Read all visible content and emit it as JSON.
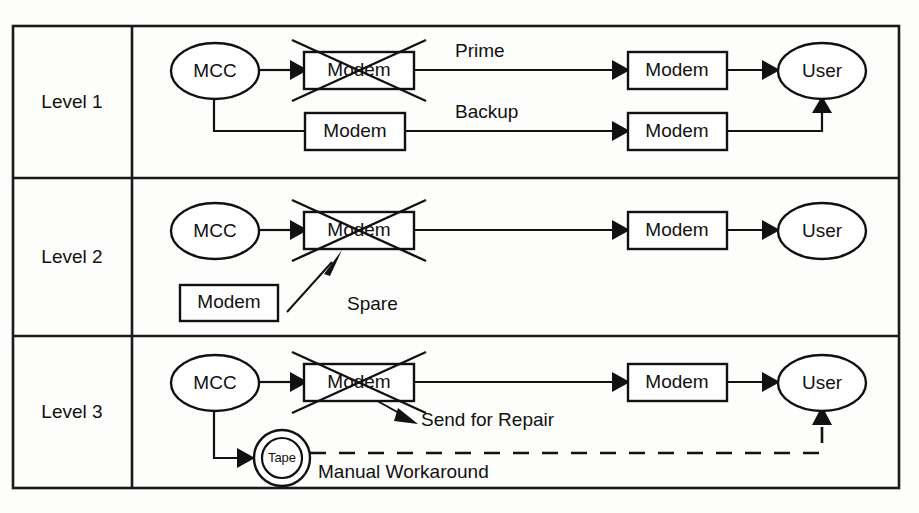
{
  "diagram": {
    "frame": {
      "stroke_color": "#1a1a1a",
      "background": "#fdfdfb"
    },
    "column_header_label": "",
    "rows": [
      {
        "id": "level-1",
        "label": "Level 1",
        "nodes": [
          {
            "id": "mcc-1",
            "label": "MCC",
            "shape": "ellipse",
            "state": "ok"
          },
          {
            "id": "modem-prime-failed-1",
            "label": "Modem",
            "shape": "rect",
            "state": "failed"
          },
          {
            "id": "modem-backup-1",
            "label": "Modem",
            "shape": "rect",
            "state": "ok"
          },
          {
            "id": "modem-far-prime-1",
            "label": "Modem",
            "shape": "rect",
            "state": "ok"
          },
          {
            "id": "modem-far-backup-1",
            "label": "Modem",
            "shape": "rect",
            "state": "ok"
          },
          {
            "id": "user-1",
            "label": "User",
            "shape": "ellipse",
            "state": "ok"
          }
        ],
        "edge_labels": [
          {
            "id": "prime-path",
            "label": "Prime"
          },
          {
            "id": "backup-path",
            "label": "Backup"
          }
        ]
      },
      {
        "id": "level-2",
        "label": "Level 2",
        "nodes": [
          {
            "id": "mcc-2",
            "label": "MCC",
            "shape": "ellipse",
            "state": "ok"
          },
          {
            "id": "modem-failed-2",
            "label": "Modem",
            "shape": "rect",
            "state": "failed"
          },
          {
            "id": "modem-spare-2",
            "label": "Modem",
            "shape": "rect",
            "state": "spare"
          },
          {
            "id": "modem-far-2",
            "label": "Modem",
            "shape": "rect",
            "state": "ok"
          },
          {
            "id": "user-2",
            "label": "User",
            "shape": "ellipse",
            "state": "ok"
          }
        ],
        "edge_labels": [
          {
            "id": "spare-path",
            "label": "Spare"
          }
        ]
      },
      {
        "id": "level-3",
        "label": "Level 3",
        "nodes": [
          {
            "id": "mcc-3",
            "label": "MCC",
            "shape": "ellipse",
            "state": "ok"
          },
          {
            "id": "modem-failed-3",
            "label": "Modem",
            "shape": "rect",
            "state": "failed"
          },
          {
            "id": "tape-3",
            "label": "Tape",
            "shape": "double-circle",
            "state": "ok"
          },
          {
            "id": "modem-far-3",
            "label": "Modem",
            "shape": "rect",
            "state": "ok"
          },
          {
            "id": "user-3",
            "label": "User",
            "shape": "ellipse",
            "state": "ok"
          }
        ],
        "edge_labels": [
          {
            "id": "send-repair-path",
            "label": "Send for Repair"
          },
          {
            "id": "manual-workaround-path",
            "label": "Manual Workaround"
          }
        ]
      }
    ]
  }
}
